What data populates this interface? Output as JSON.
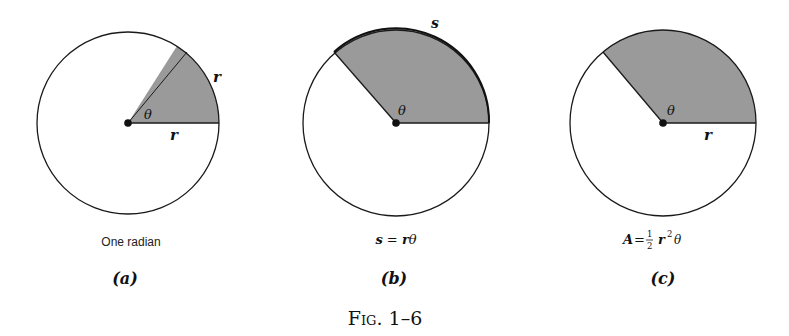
{
  "figure": {
    "caption": "Fig. 1–6",
    "colors": {
      "stroke": "#1a1a1a",
      "sector_fill": "#9a9a9a",
      "background": "#ffffff"
    },
    "panels": [
      {
        "id": "a",
        "label": "(a)",
        "caption": "One radian",
        "theta_label": "θ",
        "radius_label": "r",
        "arc_label": "r",
        "sector_angle_deg": 57.3
      },
      {
        "id": "b",
        "label": "(b)",
        "caption_parts": {
          "s": "s",
          "eq": " = ",
          "r": "r",
          "theta": "θ"
        },
        "theta_label": "θ",
        "arc_label": "s",
        "sector_angle_deg": 130
      },
      {
        "id": "c",
        "label": "(c)",
        "caption_parts": {
          "A": "A",
          "eq": " = ",
          "num": "1",
          "den": "2",
          "r": "r",
          "exp": "2",
          "theta": "θ"
        },
        "theta_label": "θ",
        "radius_label": "r",
        "sector_angle_deg": 130
      }
    ]
  }
}
